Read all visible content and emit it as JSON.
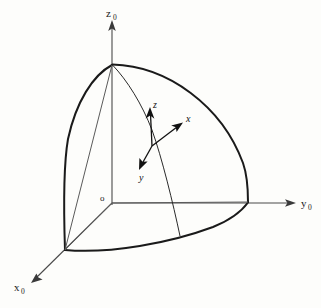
{
  "figure": {
    "background_color": "#fdfdfb",
    "line_color": "#1a1a1a",
    "axis_color": "#4a4a4a"
  },
  "global_frame": {
    "origin_label": "o",
    "axes": [
      {
        "name": "z-zero-axis",
        "label": "z",
        "subscript": "0",
        "direction": "up"
      },
      {
        "name": "y-zero-axis",
        "label": "y",
        "subscript": "0",
        "direction": "right"
      },
      {
        "name": "x-zero-axis",
        "label": "x",
        "subscript": "0",
        "direction": "down-left"
      }
    ]
  },
  "local_frame": {
    "axes": [
      {
        "name": "z-local-axis",
        "label": "z",
        "direction": "up-left"
      },
      {
        "name": "x-local-axis",
        "label": "x",
        "direction": "up-right"
      },
      {
        "name": "y-local-axis",
        "label": "y",
        "direction": "down-left"
      }
    ]
  },
  "geometry": {
    "pole_point": "top of sphere on z-axis",
    "y_axis_vertex": "sphere intersection on y-axis",
    "x_axis_vertex": "sphere intersection on x-axis",
    "surface": "one octant of a sphere"
  }
}
